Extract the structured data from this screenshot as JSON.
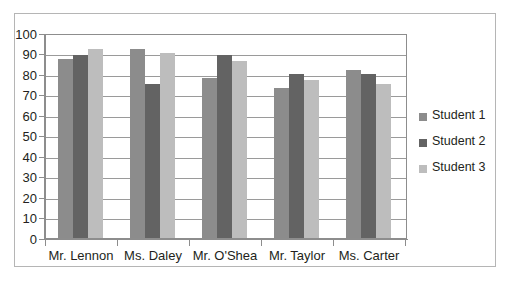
{
  "chart_data": {
    "type": "bar",
    "title": "",
    "subtitle": "",
    "xlabel": "",
    "ylabel": "",
    "categories": [
      "Mr. Lennon",
      "Ms. Daley",
      "Mr. O'Shea",
      "Mr. Taylor",
      "Ms. Carter"
    ],
    "series": [
      {
        "name": "Student 1",
        "color": "#8c8c8c",
        "values": [
          88,
          93,
          79,
          74,
          83
        ]
      },
      {
        "name": "Student 2",
        "color": "#636363",
        "values": [
          90,
          76,
          90,
          81,
          81
        ]
      },
      {
        "name": "Student 3",
        "color": "#bdbdbd",
        "values": [
          93,
          91,
          87,
          78,
          76
        ]
      }
    ],
    "ylim": [
      0,
      100
    ],
    "ytick_step": 10,
    "ytick_labels": [
      "100",
      "90",
      "80",
      "70",
      "60",
      "50",
      "40",
      "30",
      "20",
      "10",
      "0"
    ],
    "grid": true,
    "grid_axis": "y",
    "legend_position": "right",
    "legend_entries": [
      "Student 1",
      "Student 2",
      "Student 3"
    ],
    "annotations": []
  },
  "style": {
    "background": "#ffffff",
    "axis_color": "#8d8d8d",
    "grid_color": "#9a9a9a",
    "text_color": "#231f20",
    "frame_color": "#b5b5b5"
  }
}
